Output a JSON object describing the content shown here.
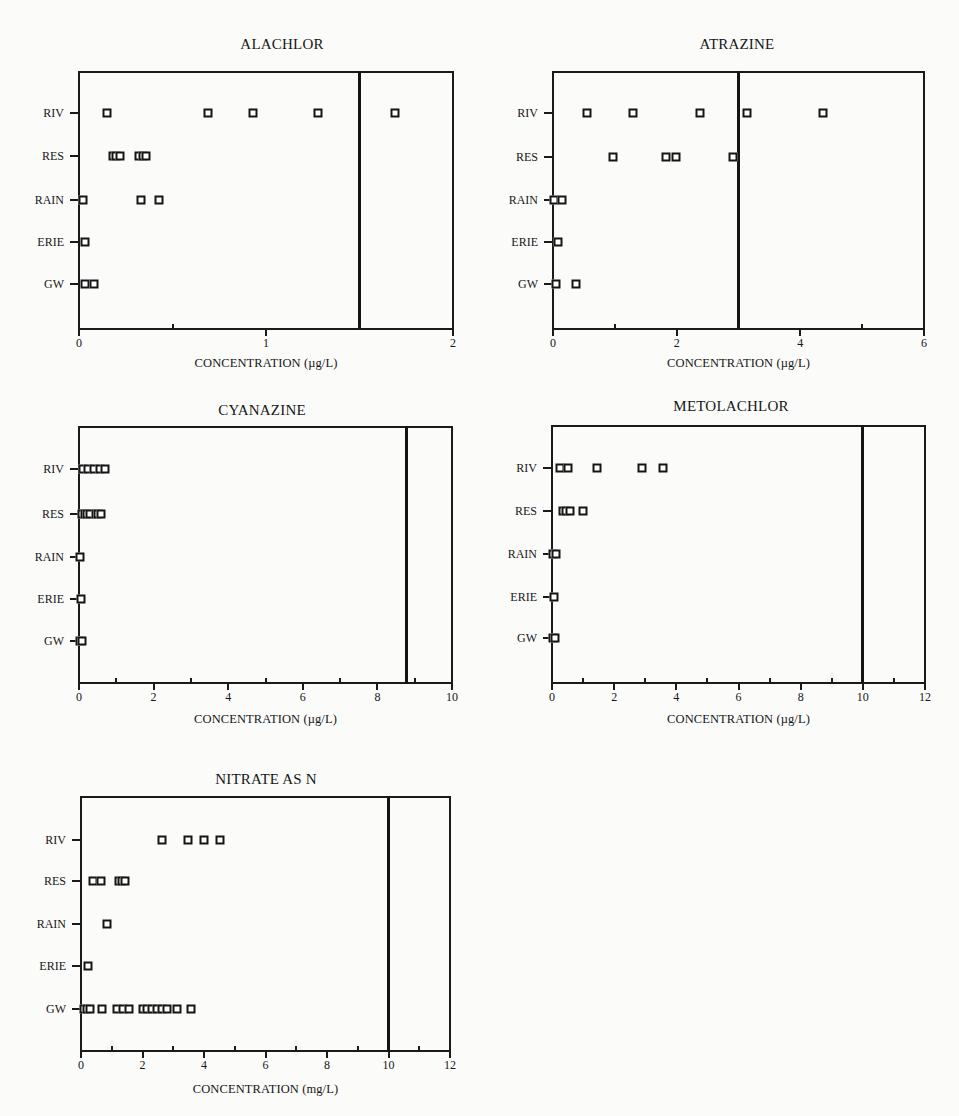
{
  "chart_data": [
    {
      "type": "scatter",
      "title": "ALACHLOR",
      "xlabel": "CONCENTRATION (µg/L)",
      "ylabel": "",
      "categories": [
        "RIV",
        "RES",
        "RAIN",
        "ERIE",
        "GW"
      ],
      "xlim": [
        0,
        2
      ],
      "xticks": [
        0,
        1,
        2
      ],
      "minor_xticks": [
        0.5,
        1.5
      ],
      "reference_line": 1.5,
      "grid": false,
      "series": [
        {
          "name": "RIV",
          "values": [
            0.15,
            0.69,
            0.93,
            1.28,
            1.69
          ]
        },
        {
          "name": "RES",
          "values": [
            0.18,
            0.2,
            0.22,
            0.32,
            0.34,
            0.36
          ]
        },
        {
          "name": "RAIN",
          "values": [
            0.02,
            0.33,
            0.43
          ]
        },
        {
          "name": "ERIE",
          "values": [
            0.03
          ]
        },
        {
          "name": "GW",
          "values": [
            0.03,
            0.08
          ]
        }
      ]
    },
    {
      "type": "scatter",
      "title": "ATRAZINE",
      "xlabel": "CONCENTRATION (µg/L)",
      "ylabel": "",
      "categories": [
        "RIV",
        "RES",
        "RAIN",
        "ERIE",
        "GW"
      ],
      "xlim": [
        0,
        6
      ],
      "xticks": [
        0,
        2,
        4,
        6
      ],
      "minor_xticks": [
        1,
        3,
        5
      ],
      "reference_line": 3,
      "grid": false,
      "series": [
        {
          "name": "RIV",
          "values": [
            0.55,
            1.29,
            2.38,
            3.14,
            4.37
          ]
        },
        {
          "name": "RES",
          "values": [
            0.97,
            1.83,
            1.99,
            2.91
          ]
        },
        {
          "name": "RAIN",
          "values": [
            0.02,
            0.15
          ]
        },
        {
          "name": "ERIE",
          "values": [
            0.08
          ]
        },
        {
          "name": "GW",
          "values": [
            0.05,
            0.37
          ]
        }
      ]
    },
    {
      "type": "scatter",
      "title": "CYANAZINE",
      "xlabel": "CONCENTRATION (µg/L)",
      "ylabel": "",
      "categories": [
        "RIV",
        "RES",
        "RAIN",
        "ERIE",
        "GW"
      ],
      "xlim": [
        0,
        10
      ],
      "xticks": [
        0,
        2,
        4,
        6,
        8,
        10
      ],
      "minor_xticks": [
        1,
        3,
        5,
        7,
        9
      ],
      "reference_line": 8.77,
      "grid": false,
      "series": [
        {
          "name": "RIV",
          "values": [
            0.1,
            0.25,
            0.4,
            0.55,
            0.7
          ]
        },
        {
          "name": "RES",
          "values": [
            0.08,
            0.15,
            0.22,
            0.3,
            0.45,
            0.52,
            0.6
          ]
        },
        {
          "name": "RAIN",
          "values": [
            0.02
          ]
        },
        {
          "name": "ERIE",
          "values": [
            0.06
          ]
        },
        {
          "name": "GW",
          "values": [
            0.02,
            0.08
          ]
        }
      ]
    },
    {
      "type": "scatter",
      "title": "METOLACHLOR",
      "xlabel": "CONCENTRATION (µg/L)",
      "ylabel": "",
      "categories": [
        "RIV",
        "RES",
        "RAIN",
        "ERIE",
        "GW"
      ],
      "xlim": [
        0,
        12
      ],
      "xticks": [
        0,
        2,
        4,
        6,
        8,
        10,
        12
      ],
      "minor_xticks": [
        1,
        3,
        5,
        7,
        9,
        11
      ],
      "reference_line": 10,
      "grid": false,
      "series": [
        {
          "name": "RIV",
          "values": [
            0.26,
            0.52,
            1.45,
            2.9,
            3.58
          ]
        },
        {
          "name": "RES",
          "values": [
            0.35,
            0.45,
            0.58,
            1.0
          ]
        },
        {
          "name": "RAIN",
          "values": [
            0.02,
            0.12
          ]
        },
        {
          "name": "ERIE",
          "values": [
            0.08
          ]
        },
        {
          "name": "GW",
          "values": [
            0.02,
            0.1
          ]
        }
      ]
    },
    {
      "type": "scatter",
      "title": "NITRATE AS N",
      "xlabel": "CONCENTRATION (mg/L)",
      "ylabel": "",
      "categories": [
        "RIV",
        "RES",
        "RAIN",
        "ERIE",
        "GW"
      ],
      "xlim": [
        0,
        12
      ],
      "xticks": [
        0,
        2,
        4,
        6,
        8,
        10,
        12
      ],
      "minor_xticks": [
        1,
        3,
        5,
        7,
        9,
        11
      ],
      "reference_line": 10,
      "grid": false,
      "series": [
        {
          "name": "RIV",
          "values": [
            2.63,
            3.48,
            4.0,
            4.52
          ]
        },
        {
          "name": "RES",
          "values": [
            0.39,
            0.65,
            1.22,
            1.32,
            1.43
          ]
        },
        {
          "name": "RAIN",
          "values": [
            0.85
          ]
        },
        {
          "name": "ERIE",
          "values": [
            0.23
          ]
        },
        {
          "name": "GW",
          "values": [
            0.1,
            0.2,
            0.3,
            0.68,
            1.17,
            1.37,
            1.56,
            2.02,
            2.15,
            2.3,
            2.47,
            2.63,
            2.8,
            3.12,
            3.58
          ]
        }
      ]
    }
  ],
  "panels": [
    {
      "title": "ALACHLOR",
      "xlabel": "CONCENTRATION (µg/L)",
      "tick_labels": [
        "0",
        "1",
        "2"
      ],
      "row_labels": [
        "RIV",
        "RES",
        "RAIN",
        "ERIE",
        "GW"
      ]
    },
    {
      "title": "ATRAZINE",
      "xlabel": "CONCENTRATION (µg/L)",
      "tick_labels": [
        "0",
        "2",
        "4",
        "6"
      ],
      "row_labels": [
        "RIV",
        "RES",
        "RAIN",
        "ERIE",
        "GW"
      ]
    },
    {
      "title": "CYANAZINE",
      "xlabel": "CONCENTRATION (µg/L)",
      "tick_labels": [
        "0",
        "2",
        "4",
        "6",
        "8",
        "10"
      ],
      "row_labels": [
        "RIV",
        "RES",
        "RAIN",
        "ERIE",
        "GW"
      ]
    },
    {
      "title": "METOLACHLOR",
      "xlabel": "CONCENTRATION (µg/L)",
      "tick_labels": [
        "0",
        "2",
        "4",
        "6",
        "8",
        "10",
        "12"
      ],
      "row_labels": [
        "RIV",
        "RES",
        "RAIN",
        "ERIE",
        "GW"
      ]
    },
    {
      "title": "NITRATE AS N",
      "xlabel": "CONCENTRATION (mg/L)",
      "tick_labels": [
        "0",
        "2",
        "4",
        "6",
        "8",
        "10",
        "12"
      ],
      "row_labels": [
        "RIV",
        "RES",
        "RAIN",
        "ERIE",
        "GW"
      ]
    }
  ],
  "colors": {
    "ink": "#151515",
    "paper": "#fbfbfa",
    "marker_fill": "#ffffff"
  }
}
